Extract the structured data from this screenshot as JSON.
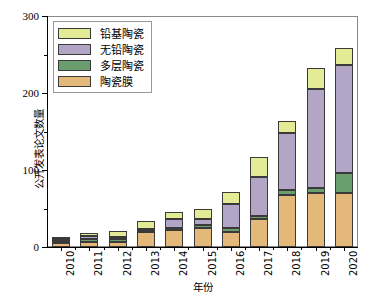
{
  "chart_data": {
    "type": "bar",
    "stacked": true,
    "title": "",
    "xlabel": "年份",
    "ylabel": "公开发表论文数量",
    "categories": [
      "2010",
      "2011",
      "2012",
      "2013",
      "2014",
      "2015",
      "2016",
      "2017",
      "2018",
      "2019",
      "2020"
    ],
    "ylim": [
      0,
      300
    ],
    "yticks": [
      0,
      100,
      200,
      300
    ],
    "yticks_minor": [
      50,
      150,
      250
    ],
    "grid": false,
    "legend_position": "upper left",
    "series": [
      {
        "name": "陶瓷膜",
        "color": "#e3b87a",
        "values": [
          5,
          7,
          7,
          19,
          22,
          25,
          19,
          37,
          68,
          70,
          70
        ]
      },
      {
        "name": "多层陶瓷",
        "color": "#6a9e6e",
        "values": [
          3,
          4,
          3,
          2,
          3,
          3,
          6,
          3,
          6,
          7,
          26
        ]
      },
      {
        "name": "无铅陶瓷",
        "color": "#b3a5c6",
        "values": [
          2,
          3,
          3,
          3,
          12,
          8,
          31,
          51,
          74,
          128,
          141
        ]
      },
      {
        "name": "铅基陶瓷",
        "color": "#e3eb94",
        "values": [
          3,
          4,
          8,
          10,
          8,
          13,
          16,
          26,
          16,
          27,
          21
        ]
      }
    ]
  },
  "legend": {
    "items": [
      {
        "label": "铅基陶瓷",
        "color": "#e3eb94"
      },
      {
        "label": "无铅陶瓷",
        "color": "#b3a5c6"
      },
      {
        "label": "多层陶瓷",
        "color": "#6a9e6e"
      },
      {
        "label": "陶瓷膜",
        "color": "#e3b87a"
      }
    ]
  },
  "axes": {
    "y_tick_labels": [
      "300",
      "200",
      "100",
      "0"
    ],
    "y_axis_title": "公开发表论文数量",
    "x_axis_title": "年份"
  }
}
